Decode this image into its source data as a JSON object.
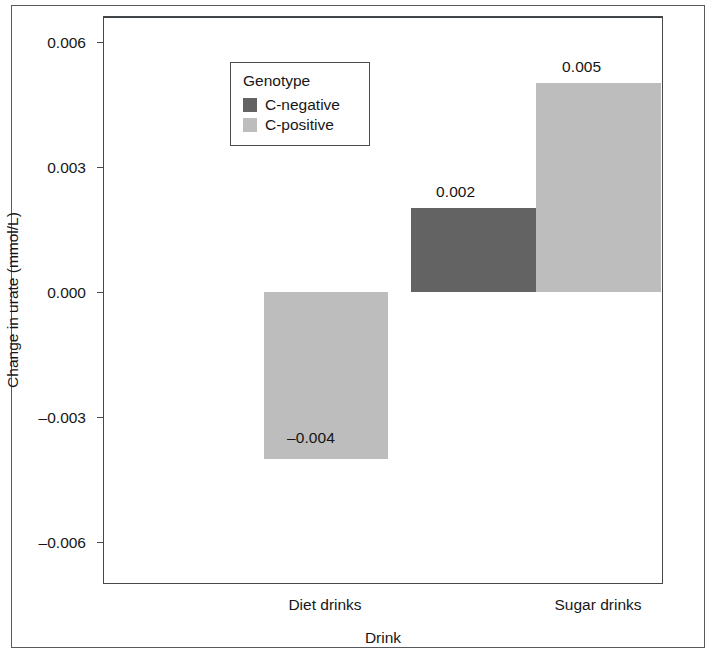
{
  "chart_data": {
    "type": "bar",
    "title": "",
    "subtitle": "",
    "xlabel": "Drink",
    "ylabel": "Change in urate (mmol/L)",
    "categories": [
      "Diet drinks",
      "Sugar drinks"
    ],
    "series": [
      {
        "name": "C-negative",
        "color": "#636363",
        "values": [
          null,
          0.002
        ],
        "value_labels": [
          "",
          "0.002"
        ]
      },
      {
        "name": "C-positive",
        "color": "#bdbdbd",
        "values": [
          -0.004,
          0.005
        ],
        "value_labels": [
          "–0.004",
          "0.005"
        ]
      }
    ],
    "ylim": [
      -0.0068,
      0.0068
    ],
    "yticks": [
      0.006,
      0.003,
      0.0,
      -0.003,
      -0.006
    ],
    "ytick_labels": [
      "0.006",
      "0.003",
      "0.000",
      "–0.003",
      "–0.006"
    ],
    "grid": false,
    "zero_line": true,
    "legend": {
      "title": "Genotype",
      "position": "upper-left-inside",
      "entries": [
        {
          "label": "C-negative",
          "color": "#636363"
        },
        {
          "label": "C-positive",
          "color": "#bdbdbd"
        }
      ]
    }
  },
  "bars": [
    {
      "name": "diet-c-positive",
      "category": "Diet drinks",
      "series": "C-positive",
      "value": -0.004,
      "label": "–0.004",
      "color": "#bdbdbd",
      "left": 160,
      "width": 124,
      "top": 275,
      "height": 167,
      "label_left": 183,
      "label_top": 412
    },
    {
      "name": "sugar-c-negative",
      "category": "Sugar drinks",
      "series": "C-negative",
      "value": 0.002,
      "label": "0.002",
      "color": "#636363",
      "left": 307,
      "width": 125,
      "top": 191,
      "height": 84,
      "label_left": 332,
      "label_top": 166
    },
    {
      "name": "sugar-c-positive",
      "category": "Sugar drinks",
      "series": "C-positive",
      "value": 0.005,
      "label": "0.005",
      "color": "#bdbdbd",
      "left": 432,
      "width": 125,
      "top": 66,
      "height": 209,
      "label_left": 458,
      "label_top": 41
    }
  ],
  "y_axis": {
    "ticks": [
      {
        "label": "0.006",
        "top": 25
      },
      {
        "label": "0.003",
        "top": 150
      },
      {
        "label": "0.000",
        "top": 275
      },
      {
        "label": "–0.003",
        "top": 400
      },
      {
        "label": "–0.006",
        "top": 525
      }
    ]
  },
  "x_axis": {
    "categories": [
      {
        "label": "Diet drinks",
        "left": 325
      },
      {
        "label": "Sugar drinks",
        "left": 598
      }
    ]
  },
  "colors": {
    "c_negative": "#636363",
    "c_positive": "#bdbdbd",
    "axis": "#45494c",
    "text": "#171717",
    "background": "#ffffff"
  }
}
